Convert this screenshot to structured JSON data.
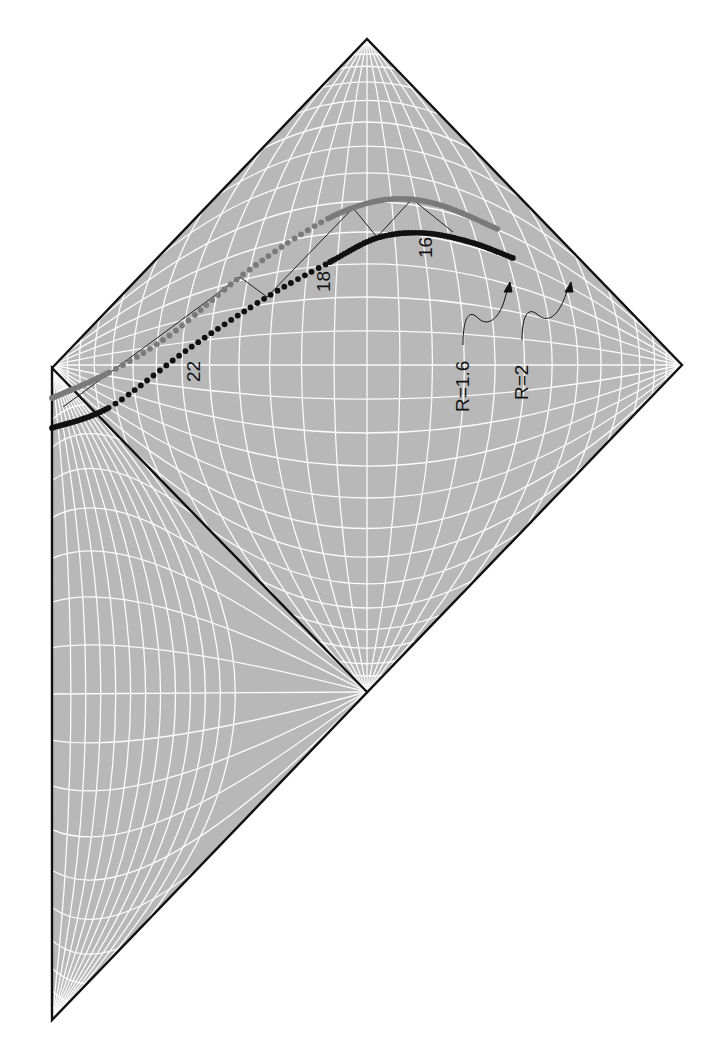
{
  "figure": {
    "type": "Penrose conformal diagram",
    "region_fill": "#b8b8b8",
    "grid_color": "#ffffff",
    "border_color": "#111111"
  },
  "regions": {
    "upper_diamond": {
      "top": [
        367,
        39
      ],
      "right": [
        682,
        365
      ],
      "bottom": [
        367,
        692
      ],
      "left": [
        52,
        368
      ]
    },
    "lower_left_triangle": {
      "top": [
        52,
        368
      ],
      "apex": [
        367,
        692
      ],
      "bottom": [
        52,
        1020
      ]
    }
  },
  "curves": [
    {
      "name": "R=2 trajectory",
      "color": "#7a7a7a",
      "style": "dotted-to-solid",
      "points": [
        [
          52,
          398
        ],
        [
          110,
          372
        ],
        [
          170,
          335
        ],
        [
          240,
          277
        ],
        [
          300,
          235
        ],
        [
          347,
          210
        ],
        [
          393,
          199
        ],
        [
          440,
          205
        ],
        [
          500,
          230
        ]
      ]
    },
    {
      "name": "R=1.6 trajectory",
      "color": "#111111",
      "style": "dotted-to-solid",
      "points": [
        [
          52,
          428
        ],
        [
          110,
          407
        ],
        [
          187,
          350
        ],
        [
          267,
          297
        ],
        [
          330,
          262
        ],
        [
          377,
          238
        ],
        [
          423,
          233
        ],
        [
          470,
          242
        ],
        [
          513,
          258
        ]
      ]
    }
  ],
  "light_rays": [
    [
      63,
      407
    ],
    [
      240,
      277
    ],
    [
      267,
      297
    ],
    [
      353,
      208
    ],
    [
      377,
      237
    ],
    [
      412,
      199
    ],
    [
      453,
      232
    ]
  ],
  "labels": {
    "tick_22": "22",
    "tick_18": "18",
    "tick_16": "16",
    "r16": "R=1.6",
    "r2": "R=2"
  }
}
